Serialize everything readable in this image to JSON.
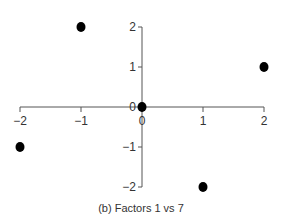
{
  "chart_data": {
    "type": "scatter",
    "title": "",
    "caption": "(b) Factors 1 vs 7",
    "xlabel": "",
    "ylabel": "",
    "x_ticks": [
      -2,
      -1,
      0,
      1,
      2
    ],
    "y_ticks": [
      -2,
      -1,
      0,
      1,
      2
    ],
    "xlim": [
      -2,
      2
    ],
    "ylim": [
      -2,
      2
    ],
    "grid": false,
    "points": [
      {
        "x": -1,
        "y": 2
      },
      {
        "x": 2,
        "y": 1
      },
      {
        "x": 0,
        "y": 0
      },
      {
        "x": -2,
        "y": -1
      },
      {
        "x": 1,
        "y": -2
      }
    ]
  }
}
